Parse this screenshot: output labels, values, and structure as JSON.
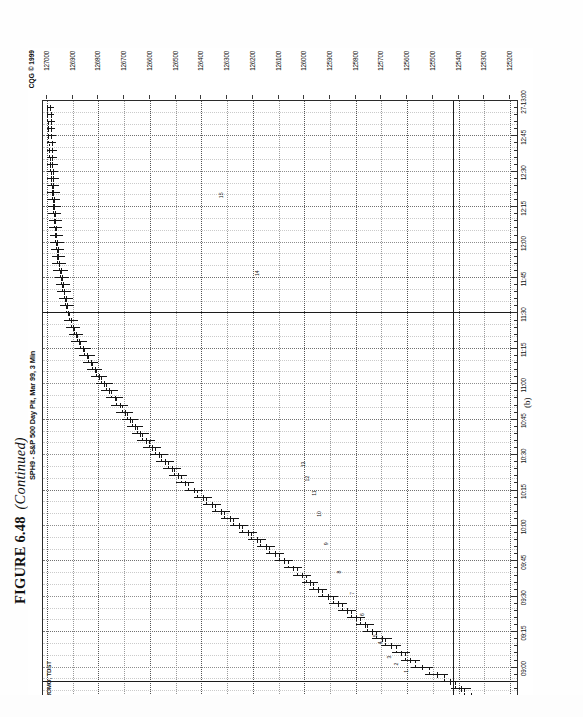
{
  "figure": {
    "number": "FIGURE 6.48",
    "continued": "(Continued)",
    "panel_letter": "(b)"
  },
  "chart_header": {
    "title": "SPH9 - S&P 500 Day Pit, Mar 99, 3 Min",
    "copyright": "CQG © 1999",
    "feed_label": "PROMO, TDST"
  },
  "chart_data": {
    "type": "ohlc",
    "title": "SPH9 - S&P 500 Day Pit, Mar 99, 3 Min",
    "symbol": "SPH9",
    "instrument": "S&P 500 Day Pit",
    "contract_month": "Mar 99",
    "interval": "3 Min",
    "xlabel": "",
    "ylabel": "",
    "grid": true,
    "legend_position": "none",
    "price_ticks": [
      "127000",
      "126900",
      "126800",
      "126700",
      "126600",
      "126500",
      "126400",
      "126300",
      "126200",
      "126100",
      "126000",
      "125900",
      "125800",
      "125700",
      "125600",
      "125500",
      "125400",
      "125300",
      "125200"
    ],
    "ylim": [
      125200,
      127000
    ],
    "time_ticks": [
      "08:45",
      "09:00",
      "09:15",
      "09:30",
      "09:45",
      "10:00",
      "10:15",
      "10:30",
      "10:45",
      "11:00",
      "11:15",
      "11:30",
      "11:45",
      "12:00",
      "12:15",
      "12:30",
      "12:45",
      "27-13:00"
    ],
    "xlim": [
      "08:45",
      "13:00"
    ],
    "reference_lines": {
      "horizontal_price": 125420,
      "vertical_time": "11:30",
      "vertical_time_open": "08:54"
    },
    "annotations": [
      {
        "text": "1",
        "time": "08:57",
        "price": 125600
      },
      {
        "text": "2",
        "time": "09:00",
        "price": 125640
      },
      {
        "text": "3",
        "time": "09:03",
        "price": 125665
      },
      {
        "text": "4",
        "time": "09:09",
        "price": 125700
      },
      {
        "text": "5",
        "time": "09:12",
        "price": 125720
      },
      {
        "text": "6",
        "time": "09:21",
        "price": 125770
      },
      {
        "text": "7",
        "time": "09:30",
        "price": 125810
      },
      {
        "text": "8",
        "time": "09:39",
        "price": 125860
      },
      {
        "text": "9",
        "time": "09:51",
        "price": 125910
      },
      {
        "text": "10",
        "time": "10:03",
        "price": 125940
      },
      {
        "text": "11",
        "time": "10:12",
        "price": 125960
      },
      {
        "text": "12",
        "time": "10:18",
        "price": 125985
      },
      {
        "text": "13",
        "time": "10:24",
        "price": 126000
      },
      {
        "text": "14",
        "time": "11:45",
        "price": 126180
      },
      {
        "text": "15",
        "time": "12:18",
        "price": 126320
      }
    ],
    "bars": [
      {
        "t": "08:45",
        "o": 125290,
        "h": 125345,
        "l": 125255,
        "c": 125330
      },
      {
        "t": "08:48",
        "o": 125330,
        "h": 125400,
        "l": 125300,
        "c": 125380
      },
      {
        "t": "08:51",
        "o": 125380,
        "h": 125430,
        "l": 125350,
        "c": 125415
      },
      {
        "t": "08:54",
        "o": 125415,
        "h": 125470,
        "l": 125395,
        "c": 125455
      },
      {
        "t": "08:57",
        "o": 125455,
        "h": 125530,
        "l": 125440,
        "c": 125515
      },
      {
        "t": "09:00",
        "o": 125515,
        "h": 125585,
        "l": 125500,
        "c": 125570
      },
      {
        "t": "09:03",
        "o": 125570,
        "h": 125625,
        "l": 125550,
        "c": 125610
      },
      {
        "t": "09:06",
        "o": 125610,
        "h": 125660,
        "l": 125590,
        "c": 125645
      },
      {
        "t": "09:09",
        "o": 125645,
        "h": 125700,
        "l": 125625,
        "c": 125685
      },
      {
        "t": "09:12",
        "o": 125685,
        "h": 125735,
        "l": 125660,
        "c": 125720
      },
      {
        "t": "09:15",
        "o": 125720,
        "h": 125770,
        "l": 125700,
        "c": 125755
      },
      {
        "t": "09:18",
        "o": 125755,
        "h": 125800,
        "l": 125730,
        "c": 125785
      },
      {
        "t": "09:21",
        "o": 125785,
        "h": 125835,
        "l": 125765,
        "c": 125820
      },
      {
        "t": "09:24",
        "o": 125820,
        "h": 125870,
        "l": 125800,
        "c": 125855
      },
      {
        "t": "09:27",
        "o": 125855,
        "h": 125905,
        "l": 125835,
        "c": 125890
      },
      {
        "t": "09:30",
        "o": 125890,
        "h": 125945,
        "l": 125870,
        "c": 125930
      },
      {
        "t": "09:33",
        "o": 125930,
        "h": 125980,
        "l": 125910,
        "c": 125965
      },
      {
        "t": "09:36",
        "o": 125965,
        "h": 126010,
        "l": 125945,
        "c": 125995
      },
      {
        "t": "09:39",
        "o": 125995,
        "h": 126045,
        "l": 125975,
        "c": 126030
      },
      {
        "t": "09:42",
        "o": 126030,
        "h": 126080,
        "l": 126010,
        "c": 126065
      },
      {
        "t": "09:45",
        "o": 126065,
        "h": 126115,
        "l": 126045,
        "c": 126100
      },
      {
        "t": "09:48",
        "o": 126100,
        "h": 126150,
        "l": 126080,
        "c": 126135
      },
      {
        "t": "09:51",
        "o": 126135,
        "h": 126185,
        "l": 126115,
        "c": 126170
      },
      {
        "t": "09:54",
        "o": 126170,
        "h": 126220,
        "l": 126150,
        "c": 126205
      },
      {
        "t": "09:57",
        "o": 126205,
        "h": 126255,
        "l": 126185,
        "c": 126240
      },
      {
        "t": "10:00",
        "o": 126240,
        "h": 126290,
        "l": 126220,
        "c": 126275
      },
      {
        "t": "10:03",
        "o": 126275,
        "h": 126325,
        "l": 126255,
        "c": 126310
      },
      {
        "t": "10:06",
        "o": 126310,
        "h": 126360,
        "l": 126290,
        "c": 126345
      },
      {
        "t": "10:09",
        "o": 126345,
        "h": 126395,
        "l": 126325,
        "c": 126380
      },
      {
        "t": "10:12",
        "o": 126380,
        "h": 126430,
        "l": 126360,
        "c": 126415
      },
      {
        "t": "10:15",
        "o": 126415,
        "h": 126465,
        "l": 126395,
        "c": 126450
      },
      {
        "t": "10:18",
        "o": 126450,
        "h": 126500,
        "l": 126430,
        "c": 126480
      },
      {
        "t": "10:21",
        "o": 126480,
        "h": 126525,
        "l": 126455,
        "c": 126505
      },
      {
        "t": "10:24",
        "o": 126505,
        "h": 126550,
        "l": 126480,
        "c": 126530
      },
      {
        "t": "10:27",
        "o": 126530,
        "h": 126575,
        "l": 126505,
        "c": 126555
      },
      {
        "t": "10:30",
        "o": 126555,
        "h": 126600,
        "l": 126530,
        "c": 126580
      },
      {
        "t": "10:33",
        "o": 126580,
        "h": 126625,
        "l": 126555,
        "c": 126605
      },
      {
        "t": "10:36",
        "o": 126605,
        "h": 126650,
        "l": 126580,
        "c": 126630
      },
      {
        "t": "10:39",
        "o": 126630,
        "h": 126670,
        "l": 126605,
        "c": 126650
      },
      {
        "t": "10:42",
        "o": 126650,
        "h": 126690,
        "l": 126625,
        "c": 126670
      },
      {
        "t": "10:45",
        "o": 126670,
        "h": 126710,
        "l": 126645,
        "c": 126690
      },
      {
        "t": "10:48",
        "o": 126690,
        "h": 126730,
        "l": 126665,
        "c": 126710
      },
      {
        "t": "10:51",
        "o": 126710,
        "h": 126750,
        "l": 126685,
        "c": 126730
      },
      {
        "t": "10:54",
        "o": 126730,
        "h": 126770,
        "l": 126705,
        "c": 126750
      },
      {
        "t": "10:57",
        "o": 126750,
        "h": 126790,
        "l": 126725,
        "c": 126770
      },
      {
        "t": "11:00",
        "o": 126770,
        "h": 126810,
        "l": 126745,
        "c": 126790
      },
      {
        "t": "11:03",
        "o": 126790,
        "h": 126830,
        "l": 126765,
        "c": 126810
      },
      {
        "t": "11:06",
        "o": 126810,
        "h": 126845,
        "l": 126785,
        "c": 126825
      },
      {
        "t": "11:09",
        "o": 126825,
        "h": 126860,
        "l": 126800,
        "c": 126840
      },
      {
        "t": "11:12",
        "o": 126840,
        "h": 126875,
        "l": 126815,
        "c": 126855
      },
      {
        "t": "11:15",
        "o": 126855,
        "h": 126890,
        "l": 126830,
        "c": 126870
      },
      {
        "t": "11:18",
        "o": 126870,
        "h": 126905,
        "l": 126845,
        "c": 126885
      },
      {
        "t": "11:21",
        "o": 126885,
        "h": 126915,
        "l": 126860,
        "c": 126895
      },
      {
        "t": "11:24",
        "o": 126895,
        "h": 126925,
        "l": 126870,
        "c": 126905
      },
      {
        "t": "11:27",
        "o": 126905,
        "h": 126935,
        "l": 126880,
        "c": 126915
      },
      {
        "t": "11:30",
        "o": 126915,
        "h": 126945,
        "l": 126890,
        "c": 126925
      },
      {
        "t": "11:33",
        "o": 126925,
        "h": 126950,
        "l": 126895,
        "c": 126930
      },
      {
        "t": "11:36",
        "o": 126930,
        "h": 126955,
        "l": 126900,
        "c": 126935
      },
      {
        "t": "11:39",
        "o": 126935,
        "h": 126960,
        "l": 126905,
        "c": 126940
      },
      {
        "t": "11:42",
        "o": 126940,
        "h": 126965,
        "l": 126910,
        "c": 126945
      },
      {
        "t": "11:45",
        "o": 126945,
        "h": 126970,
        "l": 126915,
        "c": 126950
      },
      {
        "t": "11:48",
        "o": 126950,
        "h": 126975,
        "l": 126920,
        "c": 126955
      },
      {
        "t": "11:51",
        "o": 126955,
        "h": 126980,
        "l": 126925,
        "c": 126960
      },
      {
        "t": "11:54",
        "o": 126960,
        "h": 126982,
        "l": 126930,
        "c": 126962
      },
      {
        "t": "11:57",
        "o": 126962,
        "h": 126985,
        "l": 126932,
        "c": 126965
      },
      {
        "t": "12:00",
        "o": 126965,
        "h": 126988,
        "l": 126935,
        "c": 126968
      },
      {
        "t": "12:03",
        "o": 126968,
        "h": 126990,
        "l": 126938,
        "c": 126970
      },
      {
        "t": "12:06",
        "o": 126970,
        "h": 126992,
        "l": 126940,
        "c": 126972
      },
      {
        "t": "12:09",
        "o": 126972,
        "h": 126994,
        "l": 126942,
        "c": 126974
      },
      {
        "t": "12:12",
        "o": 126974,
        "h": 126996,
        "l": 126944,
        "c": 126976
      },
      {
        "t": "12:15",
        "o": 126976,
        "h": 126998,
        "l": 126946,
        "c": 126978
      },
      {
        "t": "12:18",
        "o": 126978,
        "h": 127000,
        "l": 126948,
        "c": 126980
      },
      {
        "t": "12:21",
        "o": 126980,
        "h": 127000,
        "l": 126950,
        "c": 126982
      },
      {
        "t": "12:24",
        "o": 126982,
        "h": 127000,
        "l": 126952,
        "c": 126984
      },
      {
        "t": "12:27",
        "o": 126984,
        "h": 127000,
        "l": 126954,
        "c": 126986
      },
      {
        "t": "12:30",
        "o": 126986,
        "h": 127000,
        "l": 126956,
        "c": 126988
      },
      {
        "t": "12:33",
        "o": 126988,
        "h": 127000,
        "l": 126958,
        "c": 126990
      },
      {
        "t": "12:36",
        "o": 126990,
        "h": 127000,
        "l": 126960,
        "c": 126992
      },
      {
        "t": "12:39",
        "o": 126992,
        "h": 127000,
        "l": 126962,
        "c": 126994
      },
      {
        "t": "12:42",
        "o": 126994,
        "h": 127000,
        "l": 126964,
        "c": 126996
      },
      {
        "t": "12:45",
        "o": 126996,
        "h": 127000,
        "l": 126966,
        "c": 126998
      },
      {
        "t": "12:48",
        "o": 126998,
        "h": 127000,
        "l": 126968,
        "c": 126998
      },
      {
        "t": "12:51",
        "o": 126998,
        "h": 127000,
        "l": 126970,
        "c": 126999
      },
      {
        "t": "12:54",
        "o": 126999,
        "h": 127000,
        "l": 126972,
        "c": 127000
      },
      {
        "t": "12:57",
        "o": 127000,
        "h": 127000,
        "l": 126974,
        "c": 127000
      }
    ]
  }
}
